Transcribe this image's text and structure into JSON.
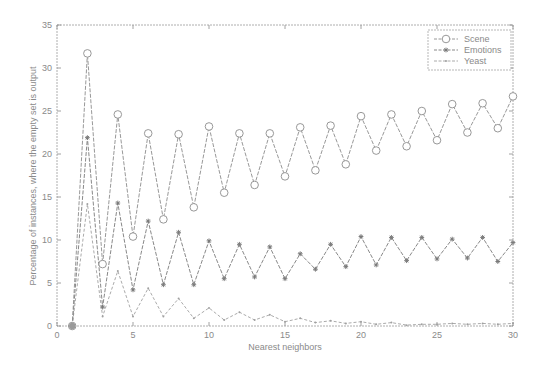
{
  "chart_data": {
    "type": "line",
    "title": "",
    "xlabel": "Nearest neighbors",
    "ylabel": "Percentage of instances, where the empty set is output",
    "xlim": [
      0,
      30
    ],
    "ylim": [
      0,
      35
    ],
    "xticks": [
      0,
      5,
      10,
      15,
      20,
      25,
      30
    ],
    "yticks": [
      0,
      5,
      10,
      15,
      20,
      25,
      30,
      35
    ],
    "grid": false,
    "legend_position": "upper right",
    "x": [
      1,
      2,
      3,
      4,
      5,
      6,
      7,
      8,
      9,
      10,
      11,
      12,
      13,
      14,
      15,
      16,
      17,
      18,
      19,
      20,
      21,
      22,
      23,
      24,
      25,
      26,
      27,
      28,
      29,
      30
    ],
    "series": [
      {
        "name": "Scene",
        "marker": "circle",
        "color": "#8c8c8c",
        "values": [
          0,
          31.7,
          7.2,
          24.6,
          10.4,
          22.4,
          12.4,
          22.3,
          13.8,
          23.2,
          15.5,
          22.4,
          16.4,
          22.4,
          17.4,
          23.1,
          18.1,
          23.3,
          18.8,
          24.4,
          20.4,
          24.6,
          20.9,
          25.0,
          21.6,
          25.8,
          22.5,
          25.9,
          23.0,
          26.7
        ]
      },
      {
        "name": "Emotions",
        "marker": "asterisk",
        "color": "#7a7a7a",
        "values": [
          0,
          21.9,
          2.2,
          14.3,
          4.2,
          12.2,
          4.8,
          10.9,
          4.8,
          9.9,
          5.5,
          9.5,
          5.7,
          9.2,
          5.5,
          8.4,
          6.6,
          9.5,
          6.9,
          10.4,
          7.1,
          10.3,
          7.6,
          10.3,
          7.8,
          10.1,
          7.9,
          10.3,
          7.5,
          9.7
        ]
      },
      {
        "name": "Yeast",
        "marker": "point",
        "color": "#a0a0a0",
        "values": [
          0,
          14.2,
          1.1,
          6.4,
          1.1,
          4.4,
          1.1,
          3.2,
          0.9,
          2.1,
          0.7,
          1.6,
          0.7,
          1.3,
          0.5,
          0.9,
          0.4,
          0.6,
          0.3,
          0.5,
          0.2,
          0.4,
          0.1,
          0.2,
          0.2,
          0.3,
          0.2,
          0.3,
          0.2,
          0.3
        ]
      }
    ]
  },
  "legend": {
    "items": [
      "Scene",
      "Emotions",
      "Yeast"
    ]
  },
  "axes": {
    "xlabel": "Nearest neighbors",
    "ylabel": "Percentage of instances, where the empty set is output"
  }
}
